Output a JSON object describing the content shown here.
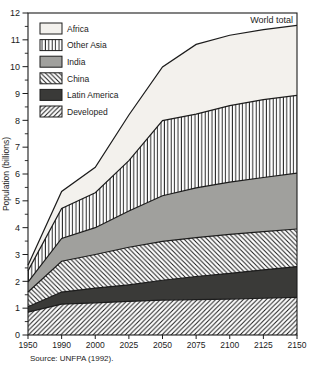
{
  "figure": {
    "world_total_label": "World total",
    "y_axis_title": "Population (billions)",
    "source": "Source: UNFPA (1992)."
  },
  "chart_data": {
    "type": "area",
    "stacked": true,
    "title": "",
    "xlabel": "",
    "ylabel": "Population (billions)",
    "ylim": [
      0,
      12
    ],
    "y_major_ticks": [
      0,
      1,
      2,
      3,
      4,
      5,
      6,
      7,
      8,
      9,
      10,
      11,
      12
    ],
    "y_minor_step": 0.5,
    "grid": false,
    "legend_position": "top-left-inside",
    "x_tick_labels": [
      "1950",
      "1990",
      "2000",
      "2025",
      "2050",
      "2075",
      "2100",
      "2125",
      "2150"
    ],
    "x_categories": [
      1950,
      1990,
      2000,
      2025,
      2050,
      2075,
      2100,
      2125,
      2150
    ],
    "series": [
      {
        "name": "Developed",
        "pattern": "diag-forward",
        "values": [
          0.85,
          1.15,
          1.2,
          1.25,
          1.3,
          1.32,
          1.34,
          1.37,
          1.4
        ]
      },
      {
        "name": "Latin America",
        "pattern": "solid-dark",
        "values": [
          0.2,
          0.45,
          0.55,
          0.62,
          0.74,
          0.86,
          0.96,
          1.06,
          1.15
        ]
      },
      {
        "name": "China",
        "pattern": "diag-backward",
        "values": [
          0.55,
          1.15,
          1.25,
          1.4,
          1.45,
          1.45,
          1.45,
          1.42,
          1.4
        ]
      },
      {
        "name": "India",
        "pattern": "solid-gray",
        "values": [
          0.37,
          0.85,
          1.0,
          1.35,
          1.7,
          1.85,
          1.95,
          2.02,
          2.08
        ]
      },
      {
        "name": "Other Asia",
        "pattern": "vertical-lines",
        "values": [
          0.42,
          1.12,
          1.3,
          1.88,
          2.8,
          2.75,
          2.85,
          2.9,
          2.9
        ]
      },
      {
        "name": "Africa",
        "pattern": "solid-light",
        "values": [
          0.21,
          0.63,
          0.95,
          1.7,
          2.0,
          2.6,
          2.62,
          2.61,
          2.61
        ]
      }
    ],
    "world_total": [
      2.6,
      5.35,
      6.25,
      8.2,
      9.99,
      10.83,
      11.17,
      11.38,
      11.54
    ],
    "legend": [
      "Africa",
      "Other Asia",
      "India",
      "China",
      "Latin America",
      "Developed"
    ],
    "colors": {
      "africa_fill": "#f3f1ed",
      "india_fill": "#a0a09d",
      "latin_america_fill": "#3a3a38",
      "hatch_line": "#1c1c1c",
      "boundary_line": "#1c1c1c",
      "background": "#ffffff"
    }
  }
}
